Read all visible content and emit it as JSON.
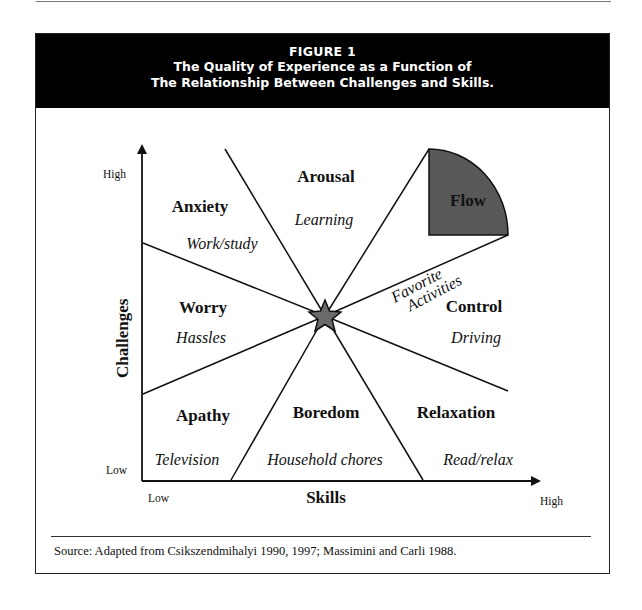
{
  "figure": {
    "number": "FIGURE 1",
    "title_line1": "The Quality of Experience as a Function of",
    "title_line2": "The Relationship Between Challenges and Skills."
  },
  "axes": {
    "y_label": "Challenges",
    "x_label": "Skills",
    "y_high": "High",
    "y_low": "Low",
    "x_low": "Low",
    "x_high": "High"
  },
  "regions": [
    {
      "id": "arousal",
      "name": "Arousal",
      "example": "Learning"
    },
    {
      "id": "flow",
      "name": "Flow",
      "example": ""
    },
    {
      "id": "favorite",
      "name": "",
      "example_line1": "Favorite",
      "example_line2": "Activities"
    },
    {
      "id": "control",
      "name": "Control",
      "example": "Driving"
    },
    {
      "id": "relaxation",
      "name": "Relaxation",
      "example": "Read/relax"
    },
    {
      "id": "boredom",
      "name": "Boredom",
      "example": "Household chores"
    },
    {
      "id": "apathy",
      "name": "Apathy",
      "example": "Television"
    },
    {
      "id": "worry",
      "name": "Worry",
      "example": "Hassles"
    },
    {
      "id": "anxiety",
      "name": "Anxiety",
      "example": "Work/study"
    }
  ],
  "colors": {
    "flow_fill": "#585858",
    "title_bg": "#000000",
    "star_fill": "#6a6a6a"
  },
  "source": "Source: Adapted from Csikszendmihalyi 1990, 1997; Massimini and Carli 1988."
}
